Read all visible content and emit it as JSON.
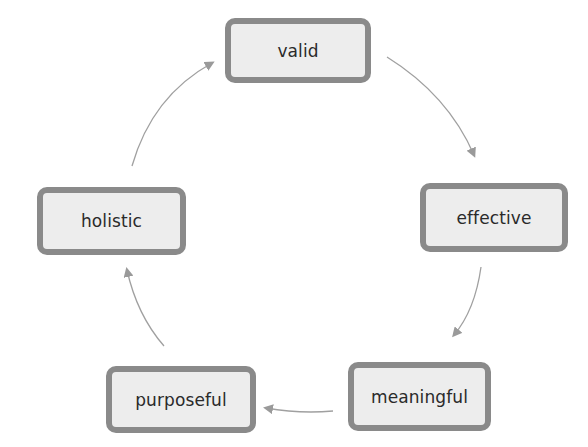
{
  "diagram": {
    "type": "cycle",
    "colors": {
      "node_fill": "#ededed",
      "node_border": "#8a8a8a",
      "arrow": "#9a9a9a",
      "text": "#2a2a2a"
    },
    "nodes": [
      {
        "id": "valid",
        "label": "valid"
      },
      {
        "id": "effective",
        "label": "effective"
      },
      {
        "id": "meaningful",
        "label": "meaningful"
      },
      {
        "id": "purposeful",
        "label": "purposeful"
      },
      {
        "id": "holistic",
        "label": "holistic"
      }
    ],
    "edges": [
      {
        "from": "valid",
        "to": "effective"
      },
      {
        "from": "effective",
        "to": "meaningful"
      },
      {
        "from": "meaningful",
        "to": "purposeful"
      },
      {
        "from": "purposeful",
        "to": "holistic"
      },
      {
        "from": "holistic",
        "to": "valid"
      }
    ]
  }
}
